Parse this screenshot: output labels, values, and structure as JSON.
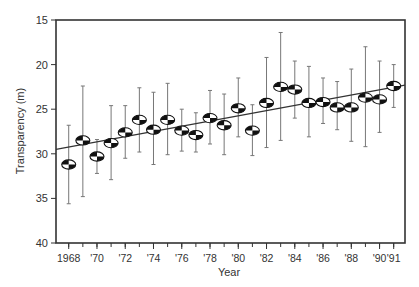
{
  "chart_data": {
    "type": "scatter",
    "title": "",
    "xlabel": "Year",
    "ylabel": "Transparency (m)",
    "y_inverted": true,
    "ylim": [
      15,
      40
    ],
    "xlim": [
      1967.1,
      1991.8
    ],
    "yticks": [
      15,
      20,
      25,
      30,
      35,
      40
    ],
    "xticks": [
      {
        "year": 1968,
        "label": "1968"
      },
      {
        "year": 1970,
        "label": "'70"
      },
      {
        "year": 1972,
        "label": "'72"
      },
      {
        "year": 1974,
        "label": "'74"
      },
      {
        "year": 1976,
        "label": "'76"
      },
      {
        "year": 1978,
        "label": "'78"
      },
      {
        "year": 1980,
        "label": "'80"
      },
      {
        "year": 1982,
        "label": "'82"
      },
      {
        "year": 1984,
        "label": "'84"
      },
      {
        "year": 1986,
        "label": "'86"
      },
      {
        "year": 1988,
        "label": "'88"
      },
      {
        "year": 1990,
        "label": "'90"
      },
      {
        "year": 1991,
        "label": "'91"
      }
    ],
    "grid": false,
    "legend": null,
    "marker": "secchi-disk",
    "series": [
      {
        "name": "Secchi depth (annual mean ± range)",
        "points": [
          {
            "x": 1968,
            "y": 31.2,
            "low": 26.8,
            "high": 35.6
          },
          {
            "x": 1969,
            "y": 28.5,
            "low": 22.4,
            "high": 34.8
          },
          {
            "x": 1970,
            "y": 30.3,
            "low": 28.4,
            "high": 32.2
          },
          {
            "x": 1971,
            "y": 28.8,
            "low": 24.6,
            "high": 32.9
          },
          {
            "x": 1972,
            "y": 27.6,
            "low": 24.6,
            "high": 30.5
          },
          {
            "x": 1973,
            "y": 26.2,
            "low": 22.6,
            "high": 29.8
          },
          {
            "x": 1974,
            "y": 27.3,
            "low": 23.1,
            "high": 31.2
          },
          {
            "x": 1975,
            "y": 26.2,
            "low": 22.1,
            "high": 30.1
          },
          {
            "x": 1976,
            "y": 27.4,
            "low": 25.0,
            "high": 29.7
          },
          {
            "x": 1977,
            "y": 27.9,
            "low": 25.4,
            "high": 29.8
          },
          {
            "x": 1978,
            "y": 26.0,
            "low": 22.9,
            "high": 28.9
          },
          {
            "x": 1979,
            "y": 26.8,
            "low": 23.3,
            "high": 30.1
          },
          {
            "x": 1980,
            "y": 24.9,
            "low": 21.5,
            "high": 28.1
          },
          {
            "x": 1981,
            "y": 27.4,
            "low": 24.5,
            "high": 30.2
          },
          {
            "x": 1982,
            "y": 24.3,
            "low": 19.2,
            "high": 29.3
          },
          {
            "x": 1983,
            "y": 22.5,
            "low": 16.4,
            "high": 28.5
          },
          {
            "x": 1984,
            "y": 22.8,
            "low": 19.6,
            "high": 26.0
          },
          {
            "x": 1985,
            "y": 24.3,
            "low": 20.2,
            "high": 28.1
          },
          {
            "x": 1986,
            "y": 24.2,
            "low": 21.5,
            "high": 26.6
          },
          {
            "x": 1987,
            "y": 24.8,
            "low": 21.9,
            "high": 27.3
          },
          {
            "x": 1988,
            "y": 24.8,
            "low": 20.5,
            "high": 28.6
          },
          {
            "x": 1989,
            "y": 23.7,
            "low": 18.0,
            "high": 29.2
          },
          {
            "x": 1990,
            "y": 23.9,
            "low": 19.6,
            "high": 27.6
          },
          {
            "x": 1991,
            "y": 22.4,
            "low": 20.0,
            "high": 24.8
          }
        ]
      }
    ],
    "trendline": {
      "x0": 1967.1,
      "y0": 29.5,
      "x1": 1991.8,
      "y1": 22.3
    }
  },
  "colors": {
    "axis": "#333333",
    "errorbar": "#777777",
    "marker_dark": "#111111",
    "marker_light": "#ffffff",
    "trendline": "#333333"
  }
}
